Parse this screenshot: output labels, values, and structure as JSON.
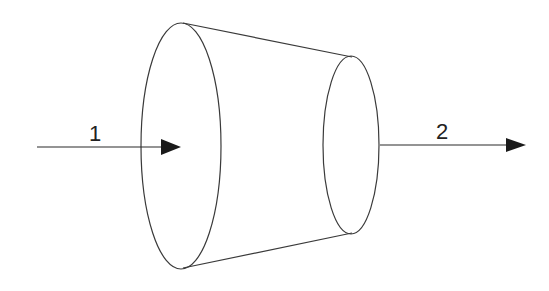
{
  "diagram": {
    "type": "truncated-cone-flow",
    "colors": {
      "stroke": "#3a3a3a",
      "arrow": "#1a1a1a",
      "background": "#ffffff"
    },
    "labels": {
      "inlet": "1",
      "outlet": "2"
    },
    "shapes": {
      "large_end": {
        "cx": 181,
        "cy": 146,
        "rx": 40,
        "ry": 123
      },
      "small_end": {
        "cx": 351,
        "cy": 145,
        "rx": 28,
        "ry": 89
      },
      "top_edge": {
        "x1": 183,
        "y1": 23,
        "x2": 352,
        "y2": 57
      },
      "bottom_edge": {
        "x1": 183,
        "y1": 268,
        "x2": 352,
        "y2": 233
      },
      "inlet_arrow": {
        "x1": 37,
        "y1": 147,
        "x2": 181,
        "y2": 147
      },
      "outlet_arrow": {
        "x1": 381,
        "y1": 145,
        "x2": 526,
        "y2": 145
      }
    }
  }
}
